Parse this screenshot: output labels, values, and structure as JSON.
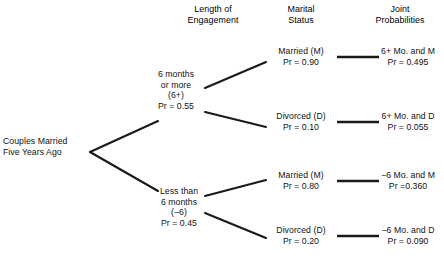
{
  "figure": {
    "type": "probability-tree",
    "headers": [
      {
        "line1": "Length of",
        "line2": "Engagement"
      },
      {
        "line1": "Marital",
        "line2": "Status"
      },
      {
        "line1": "Joint",
        "line2": "Probabilities"
      }
    ],
    "root": {
      "line1": "Couples Married",
      "line2": "Five Years Ago"
    },
    "level1": [
      {
        "line1": "6 months",
        "line2": "or more",
        "line3": "(6+)",
        "line4": "Pr = 0.55",
        "probability": 0.55
      },
      {
        "line1": "Less than",
        "line2": "6 months",
        "line3": "(−6)",
        "line4": "Pr = 0.45",
        "probability": 0.45
      }
    ],
    "level2": [
      {
        "label": "Married (M)",
        "prob_text": "Pr = 0.90",
        "probability": 0.9
      },
      {
        "label": "Divorced (D)",
        "prob_text": "Pr = 0.10",
        "probability": 0.1
      },
      {
        "label": "Married (M)",
        "prob_text": "Pr = 0.80",
        "probability": 0.8
      },
      {
        "label": "Divorced (D)",
        "prob_text": "Pr = 0.20",
        "probability": 0.2
      }
    ],
    "joint": [
      {
        "label": "6+ Mo. and M",
        "prob_text": "Pr = 0.495",
        "probability": 0.495
      },
      {
        "label": "6+ Mo. and D",
        "prob_text": "Pr = 0.055",
        "probability": 0.055
      },
      {
        "label": "−6 Mo. and M",
        "prob_text": "Pr =0.360",
        "probability": 0.36
      },
      {
        "label": "−6 Mo. and D",
        "prob_text": "Pr = 0.090",
        "probability": 0.09
      }
    ],
    "colors": {
      "line": "#1a1a1a",
      "text": "#111111",
      "background": "#ffffff"
    }
  }
}
